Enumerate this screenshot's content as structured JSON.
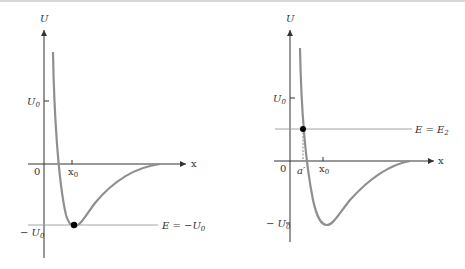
{
  "figure": {
    "panels": [
      {
        "id": "left",
        "y_axis_label": "U",
        "x_axis_label": "x",
        "origin_label": "0",
        "x_ticks": [
          {
            "label": "x",
            "sub": "0"
          }
        ],
        "y_ticks": [
          {
            "label": "U",
            "sub": "0"
          },
          {
            "label": "− U",
            "sub": "0"
          }
        ],
        "energy_line_label": "E = −U",
        "energy_line_sub": "0",
        "marked_point": "minimum of potential at x0, E = -U0"
      },
      {
        "id": "right",
        "y_axis_label": "U",
        "x_axis_label": "x",
        "origin_label": "0",
        "x_ticks": [
          {
            "label": "a′",
            "sub": ""
          },
          {
            "label": "x",
            "sub": "0"
          }
        ],
        "y_ticks": [
          {
            "label": "U",
            "sub": "0"
          },
          {
            "label": "− U",
            "sub": "0"
          }
        ],
        "energy_line_label": "E = E",
        "energy_line_sub": "2",
        "marked_point": "turning point at a′, E = E2"
      }
    ],
    "colors": {
      "curve": "#8f8f8f",
      "axis": "#333333",
      "energy_line": "#9a9a9a",
      "point": "#000000"
    }
  }
}
